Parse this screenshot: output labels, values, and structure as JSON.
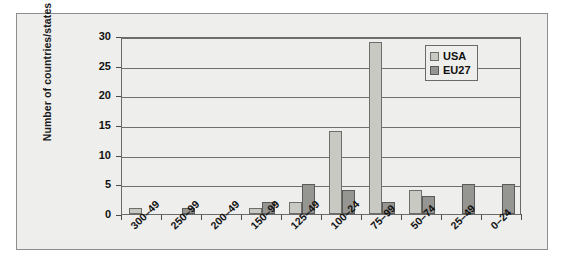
{
  "chart_data": {
    "type": "bar",
    "title": "",
    "subtitle": "",
    "xlabel": "",
    "ylabel": "Number of countries/states",
    "ylim": [
      0,
      30
    ],
    "yticks": [
      0,
      5,
      10,
      15,
      20,
      25,
      30
    ],
    "ytick_labels": [
      "0",
      "5",
      "10",
      "15",
      "20",
      "25",
      "30"
    ],
    "grid": true,
    "grid_axis": "y",
    "legend_position": "top-right",
    "categories": [
      "300–49",
      "250–99",
      "200–49",
      "150–99",
      "125–49",
      "100–24",
      "75–99",
      "50–74",
      "25–49",
      "0–24"
    ],
    "series": [
      {
        "name": "USA",
        "color": "#c9c9c4",
        "edge_color": "#6d6d6a",
        "values": [
          1,
          0,
          0,
          1,
          2,
          14,
          29,
          4,
          0,
          0
        ]
      },
      {
        "name": "EU27",
        "color": "#959591",
        "edge_color": "#5a5a58",
        "values": [
          0,
          1,
          0,
          2,
          5,
          4,
          2,
          3,
          5,
          5
        ]
      }
    ]
  },
  "figure": {
    "background_color": "#eeeeec",
    "frame_color": "#8d8d8d",
    "plot_line_color": "#6f6f6f"
  },
  "legend": {
    "entries": [
      {
        "label": "USA"
      },
      {
        "label": "EU27"
      }
    ]
  }
}
